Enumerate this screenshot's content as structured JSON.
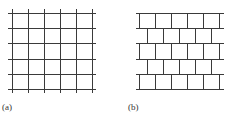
{
  "figures": [
    {
      "id": "a",
      "label": "(a)",
      "pattern": "square-grid",
      "h_lines_y": [
        13,
        28,
        43,
        59,
        74,
        89
      ],
      "h_x_range": [
        8,
        96
      ],
      "v_lines_x": [
        12,
        28,
        44,
        60,
        76,
        92
      ],
      "v_y_range": [
        9,
        93
      ]
    },
    {
      "id": "b",
      "label": "(b)",
      "pattern": "brick-offset",
      "h_lines_y": [
        13,
        28,
        43,
        59,
        74,
        89
      ],
      "h_x_range": [
        136,
        224
      ],
      "odd_row_v_x": [
        139,
        155,
        171,
        187,
        203,
        219
      ],
      "even_row_v_x": [
        147,
        163,
        179,
        195,
        211
      ]
    }
  ],
  "colors": {
    "line": "#3a3a3a",
    "background": "#ffffff"
  }
}
